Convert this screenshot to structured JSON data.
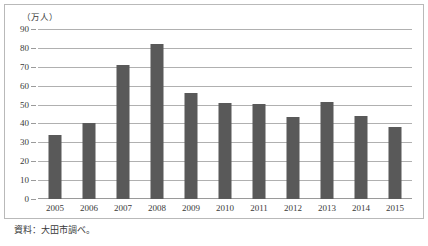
{
  "chart_data": {
    "type": "bar",
    "title": "",
    "subtitle": "",
    "xlabel": "",
    "ylabel": "（万人）",
    "ylim": [
      0,
      90
    ],
    "ytick_step": 10,
    "yticks": [
      0,
      10,
      20,
      30,
      40,
      50,
      60,
      70,
      80,
      90
    ],
    "grid": true,
    "legend": false,
    "legend_position": "none",
    "categories": [
      "2005",
      "2006",
      "2007",
      "2008",
      "2009",
      "2010",
      "2011",
      "2012",
      "2013",
      "2014",
      "2015"
    ],
    "values": [
      34,
      40,
      71,
      82,
      56,
      51,
      50.5,
      43.5,
      51.5,
      44,
      38
    ],
    "series": [
      {
        "name": "",
        "values": [
          34,
          40,
          71,
          82,
          56,
          51,
          50.5,
          43.5,
          51.5,
          44,
          38
        ]
      }
    ],
    "annotations": []
  },
  "figure": {
    "unit_caption": "（万人）",
    "source_note": "資料：大田市調べ。"
  },
  "colors": {
    "bar": "#595959",
    "gridline": "#b0b0b0",
    "baseline": "#9a9a9a",
    "frame": "#b9b9b9",
    "text": "#3a3a3a",
    "background": "#ffffff"
  }
}
